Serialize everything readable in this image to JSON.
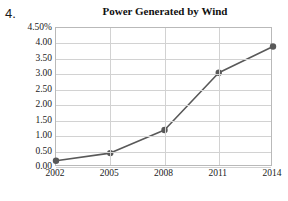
{
  "question_number": "4.",
  "chart_data": {
    "type": "line",
    "title": "Power Generated by Wind",
    "xlabel": "",
    "ylabel": "",
    "categories": [
      "2002",
      "2005",
      "2008",
      "2011",
      "2014"
    ],
    "x": [
      2002,
      2005,
      2008,
      2011,
      2014
    ],
    "values": [
      0.2,
      0.45,
      1.2,
      3.05,
      3.9
    ],
    "series": [
      {
        "name": "Power Generated by Wind",
        "values": [
          0.2,
          0.45,
          1.2,
          3.05,
          3.9
        ]
      }
    ],
    "ylim": [
      0.0,
      4.5
    ],
    "ytick_labels": [
      "0.00",
      "0.50",
      "1.00",
      "1.50",
      "2.00",
      "2.50",
      "3.00",
      "3.50",
      "4.00",
      "4.50%"
    ],
    "ytick_values": [
      0.0,
      0.5,
      1.0,
      1.5,
      2.0,
      2.5,
      3.0,
      3.5,
      4.0,
      4.5
    ],
    "grid": true,
    "legend": false,
    "unit": "%",
    "line_color": "#595959",
    "marker_color": "#595959",
    "grid_color": "#d2d2d2",
    "frame_color": "#b9b9b9"
  }
}
